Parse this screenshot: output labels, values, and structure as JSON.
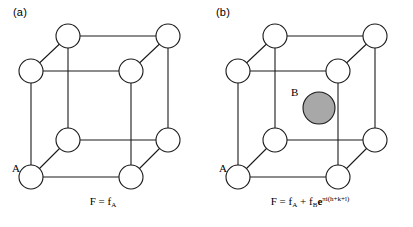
{
  "figure": {
    "background_color": "#ffffff",
    "line_color": "#1a1a1a",
    "atom_a_fill": "#ffffff",
    "atom_b_fill": "#a8a8a8"
  },
  "panels": [
    {
      "label": "(a)",
      "corner_atom_label": "A",
      "center_atom_label": "",
      "formula": {
        "lhs": "F",
        "equals": "=",
        "term1_base": "f",
        "term1_sub": "A",
        "plus": "",
        "term2_base": "",
        "term2_sub": "",
        "exp_base": "",
        "exp_sup": ""
      }
    },
    {
      "label": "(b)",
      "corner_atom_label": "A",
      "center_atom_label": "B",
      "formula": {
        "lhs": "F",
        "equals": "=",
        "term1_base": "f",
        "term1_sub": "A",
        "plus": "+",
        "term2_base": "f",
        "term2_sub": "B",
        "exp_base": "e",
        "exp_sup": "πi(h+k+l)"
      }
    }
  ]
}
